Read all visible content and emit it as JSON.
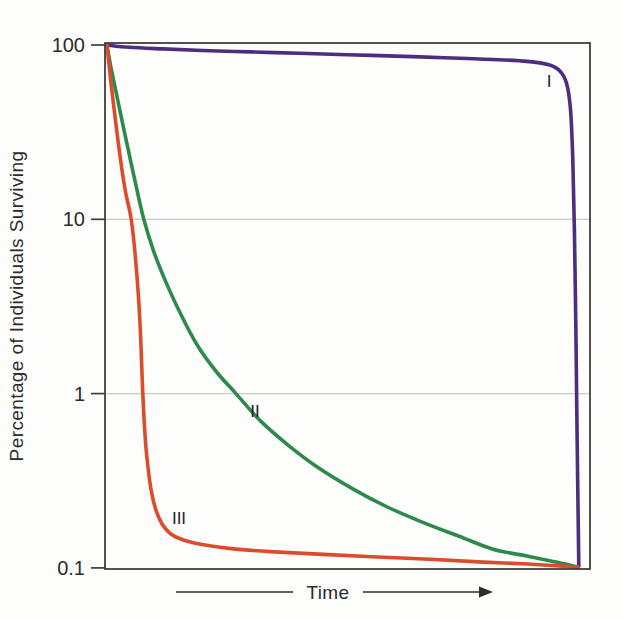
{
  "figure": {
    "width": 623,
    "height": 618,
    "background": "#fdfdfb"
  },
  "chart_data": {
    "type": "line",
    "title": "",
    "xlabel": "Time",
    "ylabel": "Percentage of Individuals Surviving",
    "x_axis": {
      "label": "Time",
      "arrow_direction": "right",
      "ticks": []
    },
    "y_axis": {
      "scale": "log",
      "unit": "%",
      "range": [
        0.1,
        100
      ],
      "tick_labels": [
        "100",
        "10",
        "1",
        "0.1"
      ],
      "tick_values": [
        100,
        10,
        1,
        0.1
      ]
    },
    "grid": {
      "horizontal_at": [
        10,
        1
      ]
    },
    "legend": "none",
    "point_format": "[time_fraction_0_to_1, percent_surviving]",
    "series": [
      {
        "name": "I",
        "color": "#4e2d7f",
        "points": [
          [
            0.004,
            100
          ],
          [
            0.05,
            97
          ],
          [
            0.12,
            95
          ],
          [
            0.2,
            93
          ],
          [
            0.3,
            91.3
          ],
          [
            0.4,
            89.6
          ],
          [
            0.5,
            88
          ],
          [
            0.6,
            86.4
          ],
          [
            0.7,
            84.6
          ],
          [
            0.8,
            82.6
          ],
          [
            0.87,
            80.5
          ],
          [
            0.915,
            77
          ],
          [
            0.938,
            71
          ],
          [
            0.952,
            60
          ],
          [
            0.96,
            42
          ],
          [
            0.9645,
            22
          ],
          [
            0.968,
            8
          ],
          [
            0.9708,
            2.5
          ],
          [
            0.9728,
            0.8
          ],
          [
            0.9748,
            0.28
          ],
          [
            0.9765,
            0.125
          ],
          [
            0.977,
            0.102
          ]
        ]
      },
      {
        "name": "II",
        "color": "#2e8a4c",
        "points": [
          [
            0.004,
            100
          ],
          [
            0.012,
            75
          ],
          [
            0.022,
            55
          ],
          [
            0.034,
            38
          ],
          [
            0.048,
            25
          ],
          [
            0.062,
            16.5
          ],
          [
            0.08,
            10
          ],
          [
            0.1,
            6.6
          ],
          [
            0.125,
            4.4
          ],
          [
            0.155,
            2.9
          ],
          [
            0.19,
            1.9
          ],
          [
            0.23,
            1.33
          ],
          [
            0.27,
            1.0
          ],
          [
            0.32,
            0.7
          ],
          [
            0.38,
            0.5
          ],
          [
            0.44,
            0.375
          ],
          [
            0.51,
            0.285
          ],
          [
            0.58,
            0.225
          ],
          [
            0.65,
            0.185
          ],
          [
            0.73,
            0.152
          ],
          [
            0.8,
            0.128
          ],
          [
            0.87,
            0.117
          ],
          [
            0.93,
            0.108
          ],
          [
            0.975,
            0.101
          ]
        ]
      },
      {
        "name": "III",
        "color": "#db4c2c",
        "points": [
          [
            0.004,
            100
          ],
          [
            0.012,
            62
          ],
          [
            0.022,
            36
          ],
          [
            0.032,
            22
          ],
          [
            0.042,
            14.5
          ],
          [
            0.054,
            10
          ],
          [
            0.064,
            5.5
          ],
          [
            0.072,
            2.6
          ],
          [
            0.078,
            1.0
          ],
          [
            0.083,
            0.55
          ],
          [
            0.089,
            0.37
          ],
          [
            0.096,
            0.27
          ],
          [
            0.105,
            0.215
          ],
          [
            0.118,
            0.178
          ],
          [
            0.135,
            0.157
          ],
          [
            0.16,
            0.145
          ],
          [
            0.2,
            0.136
          ],
          [
            0.26,
            0.129
          ],
          [
            0.34,
            0.124
          ],
          [
            0.44,
            0.12
          ],
          [
            0.55,
            0.116
          ],
          [
            0.67,
            0.112
          ],
          [
            0.78,
            0.108
          ],
          [
            0.88,
            0.105
          ],
          [
            0.975,
            0.101
          ]
        ]
      }
    ],
    "annotations": [
      {
        "text": "I",
        "x_px": 549,
        "y_px": 87
      },
      {
        "text": "II",
        "x_px": 255,
        "y_px": 417
      },
      {
        "text": "III",
        "x_px": 179,
        "y_px": 524
      }
    ],
    "layout": {
      "plot_px": {
        "left": 105,
        "right": 590,
        "top": 43,
        "bottom": 569
      },
      "y_100_px": 45,
      "decade_px": 174.3,
      "axis_color": "#3f3f3f",
      "grid_color": "#c9cdc9",
      "text_color": "#2b2b2b",
      "curve_stroke_width": 3.6
    }
  },
  "x_axis_arrow": {
    "left_line_x": [
      176,
      293
    ],
    "right_line_x": [
      363,
      479
    ],
    "arrow_tip_x": 493,
    "y_px": 592
  }
}
